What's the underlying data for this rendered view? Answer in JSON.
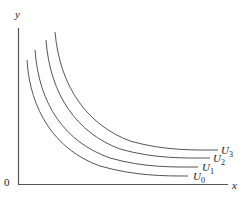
{
  "diagram": {
    "axes": {
      "y_label": "y",
      "x_label": "x",
      "origin_label": "0"
    },
    "curves": [
      {
        "id": "U0",
        "label_main": "U",
        "label_sub": "0"
      },
      {
        "id": "U1",
        "label_main": "U",
        "label_sub": "1"
      },
      {
        "id": "U2",
        "label_main": "U",
        "label_sub": "2"
      },
      {
        "id": "U3",
        "label_main": "U",
        "label_sub": "3"
      }
    ],
    "colors": {
      "line": "#555555",
      "text": "#222222",
      "background": "#ffffff"
    }
  }
}
